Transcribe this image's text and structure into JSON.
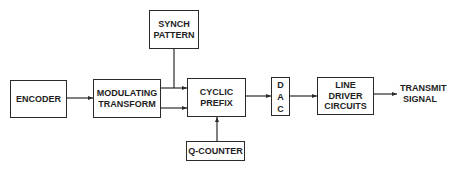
{
  "diagram": {
    "type": "block-diagram",
    "blocks": {
      "encoder": {
        "lines": [
          "ENCODER"
        ]
      },
      "modulating_transform": {
        "lines": [
          "MODULATING",
          "TRANSFORM"
        ]
      },
      "synch_pattern": {
        "lines": [
          "SYNCH",
          "PATTERN"
        ]
      },
      "cyclic_prefix": {
        "lines": [
          "CYCLIC",
          "PREFIX"
        ]
      },
      "q_counter": {
        "lines": [
          "Q-COUNTER"
        ]
      },
      "dac": {
        "lines": [
          "D",
          "A",
          "C"
        ]
      },
      "line_driver": {
        "lines": [
          "LINE DRIVER",
          "CIRCUITS"
        ]
      }
    },
    "output_label": {
      "lines": [
        "TRANSMIT",
        "SIGNAL"
      ]
    },
    "connections": [
      {
        "from": "ENCODER",
        "to": "MODULATING TRANSFORM"
      },
      {
        "from": "MODULATING TRANSFORM",
        "to": "CYCLIC PREFIX",
        "count": 2
      },
      {
        "from": "SYNCH PATTERN",
        "to": "CYCLIC PREFIX"
      },
      {
        "from": "Q-COUNTER",
        "to": "CYCLIC PREFIX"
      },
      {
        "from": "CYCLIC PREFIX",
        "to": "DAC"
      },
      {
        "from": "DAC",
        "to": "LINE DRIVER CIRCUITS"
      },
      {
        "from": "LINE DRIVER CIRCUITS",
        "to": "TRANSMIT SIGNAL"
      }
    ],
    "colors": {
      "line": "#2a2a2a",
      "text": "#1e1e1e",
      "background": "#ffffff"
    }
  }
}
